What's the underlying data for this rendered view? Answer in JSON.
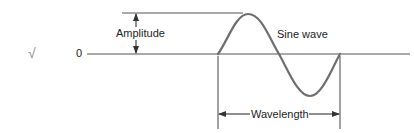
{
  "diagram": {
    "labels": {
      "zero": "0",
      "amplitude": "Amplitude",
      "sine_wave": "Sine wave",
      "wavelength": "Wavelength",
      "check_mark": "√"
    },
    "colors": {
      "line": "#555555",
      "wave": "#6e6e6e",
      "text": "#222222",
      "check": "#8a8a8a"
    }
  }
}
